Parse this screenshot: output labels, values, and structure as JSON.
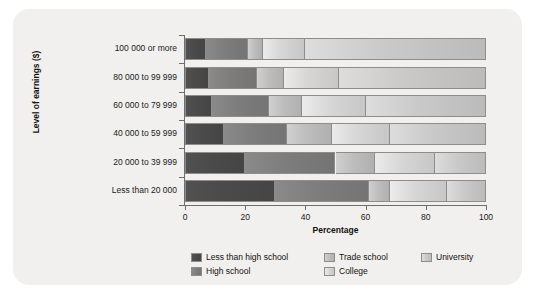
{
  "chart_data": {
    "type": "bar",
    "orientation": "horizontal",
    "stacked": true,
    "title": "",
    "xlabel": "Percentage",
    "ylabel": "Level of earnings ($)",
    "xlim": [
      0,
      100
    ],
    "xticks": [
      0,
      20,
      40,
      60,
      80,
      100
    ],
    "xticklabels": [
      "0",
      "20",
      "40",
      "60",
      "80",
      "100"
    ],
    "grid": false,
    "legend_position": "bottom",
    "categories": [
      "100 000 or more",
      "80 000 to 99 999",
      "60 000 to 79 999",
      "40 000 to 59 999",
      "20 000 to 39 999",
      "Less than 20 000"
    ],
    "series": [
      {
        "name": "Less than high school",
        "color": "#4a4a4a",
        "values": [
          7,
          8,
          9,
          13,
          20,
          30
        ]
      },
      {
        "name": "High school",
        "color": "#7d7d7d",
        "values": [
          14,
          16,
          19,
          21,
          30,
          31
        ]
      },
      {
        "name": "Trade school",
        "color": "#bdbdbd",
        "values": [
          5,
          9,
          11,
          15,
          13,
          7
        ]
      },
      {
        "name": "College",
        "color": "#d6d6d6",
        "values": [
          14,
          18,
          21,
          19,
          20,
          19
        ]
      },
      {
        "name": "University",
        "color": "#c9c9c9",
        "values": [
          60,
          49,
          40,
          32,
          17,
          13
        ]
      }
    ]
  },
  "legend": {
    "items": [
      {
        "label": "Less than high school"
      },
      {
        "label": "High school"
      },
      {
        "label": "Trade school"
      },
      {
        "label": "College"
      },
      {
        "label": "University"
      }
    ]
  }
}
